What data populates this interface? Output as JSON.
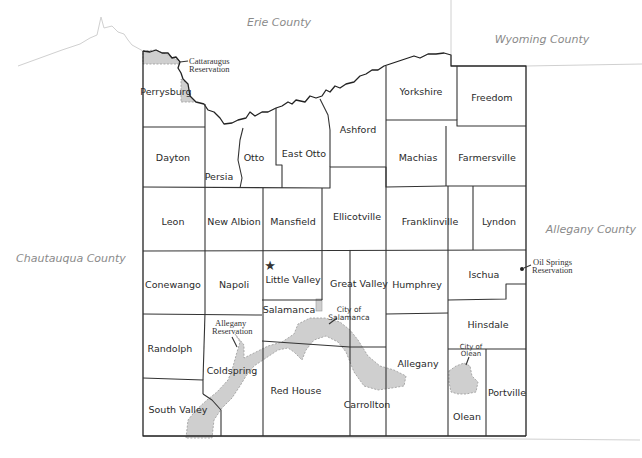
{
  "map": {
    "neighbors": {
      "north": "Erie County",
      "northeast": "Wyoming County",
      "east": "Allegany County",
      "west": "Chautauqua County"
    },
    "towns": [
      {
        "id": "perrysburg",
        "label": "Perrysburg"
      },
      {
        "id": "dayton",
        "label": "Dayton"
      },
      {
        "id": "persia",
        "label": "Persia"
      },
      {
        "id": "otto",
        "label": "Otto"
      },
      {
        "id": "east-otto",
        "label": "East Otto"
      },
      {
        "id": "ashford",
        "label": "Ashford"
      },
      {
        "id": "yorkshire",
        "label": "Yorkshire"
      },
      {
        "id": "freedom",
        "label": "Freedom"
      },
      {
        "id": "machias",
        "label": "Machias"
      },
      {
        "id": "farmersville",
        "label": "Farmersville"
      },
      {
        "id": "leon",
        "label": "Leon"
      },
      {
        "id": "new-albion",
        "label": "New Albion"
      },
      {
        "id": "mansfield",
        "label": "Mansfield"
      },
      {
        "id": "ellicottville",
        "label": "Ellicotville"
      },
      {
        "id": "franklinville",
        "label": "Franklinville"
      },
      {
        "id": "lyndon",
        "label": "Lyndon"
      },
      {
        "id": "conewango",
        "label": "Conewango"
      },
      {
        "id": "napoli",
        "label": "Napoli"
      },
      {
        "id": "little-valley",
        "label": "Little Valley"
      },
      {
        "id": "great-valley",
        "label": "Great Valley"
      },
      {
        "id": "humphrey",
        "label": "Humphrey"
      },
      {
        "id": "ischua",
        "label": "Ischua"
      },
      {
        "id": "salamanca",
        "label": "Salamanca"
      },
      {
        "id": "hinsdale",
        "label": "Hinsdale"
      },
      {
        "id": "randolph",
        "label": "Randolph"
      },
      {
        "id": "coldspring",
        "label": "Coldspring"
      },
      {
        "id": "red-house",
        "label": "Red House"
      },
      {
        "id": "carrollton",
        "label": "Carrollton"
      },
      {
        "id": "allegany",
        "label": "Allegany"
      },
      {
        "id": "olean",
        "label": "Olean"
      },
      {
        "id": "portville",
        "label": "Portville"
      },
      {
        "id": "south-valley",
        "label": "South Valley"
      }
    ],
    "annotations": {
      "cattaraugus_res_1": "Cattaraugus",
      "cattaraugus_res_2": "Reservation",
      "allegany_res_1": "Allegany",
      "allegany_res_2": "Reservation",
      "oil_springs_1": "Oil Springs",
      "oil_springs_2": "Reservation",
      "city_salamanca_1": "City of",
      "city_salamanca_2": "Salamanca",
      "city_olean_1": "City of",
      "city_olean_2": "Olean"
    },
    "county_seat_symbol": "★",
    "colors": {
      "border": "#333333",
      "reservation_fill": "#cfcfcf",
      "neighbor_label": "#8a8a8a"
    }
  }
}
